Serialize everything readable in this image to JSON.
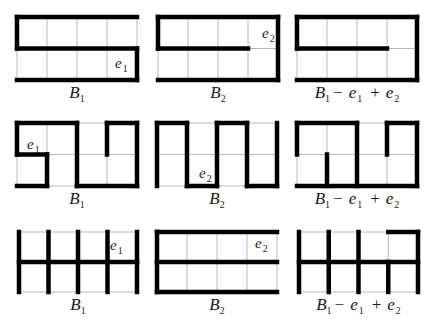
{
  "figure": {
    "grid": {
      "cols": 4,
      "rows": 2
    },
    "rows": [
      {
        "panels": [
          {
            "id": "r1p1",
            "caption": {
              "base": "B",
              "sub": "1"
            },
            "origin": [
              17,
              17
            ],
            "cell": [
              30,
              31.5
            ],
            "edge_label": {
              "text": "e",
              "sub": "1",
              "pos": [
                115,
                68
              ]
            },
            "edges": [
              [
                0,
                0,
                4,
                0
              ],
              [
                0,
                0,
                0,
                1
              ],
              [
                0,
                1,
                4,
                1
              ],
              [
                4,
                1,
                4,
                2
              ],
              [
                0,
                2,
                4,
                2
              ]
            ]
          },
          {
            "id": "r1p2",
            "caption": {
              "base": "B",
              "sub": "2"
            },
            "origin": [
              158,
              17
            ],
            "cell": [
              30,
              31.5
            ],
            "edge_label": {
              "text": "e",
              "sub": "2",
              "pos": [
                262,
                38
              ]
            },
            "edges": [
              [
                0,
                0,
                4,
                0
              ],
              [
                0,
                0,
                0,
                1
              ],
              [
                0,
                1,
                3,
                1
              ],
              [
                4,
                0,
                4,
                2
              ],
              [
                0,
                2,
                4,
                2
              ]
            ]
          },
          {
            "id": "r1p3",
            "caption": {
              "base": "B",
              "sub": "1",
              "minus": "e",
              "minus_sub": "1",
              "plus": "e",
              "plus_sub": "2"
            },
            "origin": [
              297,
              17
            ],
            "cell": [
              30,
              31.5
            ],
            "edges": [
              [
                0,
                0,
                4,
                0
              ],
              [
                0,
                0,
                0,
                1
              ],
              [
                0,
                1,
                3,
                1
              ],
              [
                4,
                0,
                4,
                2
              ],
              [
                0,
                2,
                4,
                2
              ]
            ]
          }
        ]
      },
      {
        "panels": [
          {
            "id": "r2p1",
            "caption": {
              "base": "B",
              "sub": "1"
            },
            "origin": [
              17,
              123
            ],
            "cell": [
              30,
              31.5
            ],
            "edge_label": {
              "text": "e",
              "sub": "1",
              "pos": [
                27,
                149
              ]
            },
            "edges": [
              [
                0,
                0,
                2,
                0
              ],
              [
                0,
                0,
                0,
                1
              ],
              [
                0,
                1,
                1,
                1
              ],
              [
                1,
                1,
                1,
                2
              ],
              [
                0,
                2,
                1,
                2
              ],
              [
                2,
                0,
                2,
                2
              ],
              [
                2,
                2,
                4,
                2
              ],
              [
                4,
                0,
                4,
                2
              ],
              [
                3,
                0,
                4,
                0
              ],
              [
                3,
                0,
                3,
                1
              ]
            ]
          },
          {
            "id": "r2p2",
            "caption": {
              "base": "B",
              "sub": "2"
            },
            "origin": [
              157,
              123
            ],
            "cell": [
              30,
              31.5
            ],
            "edge_label": {
              "text": "e",
              "sub": "2",
              "pos": [
                199,
                178
              ]
            },
            "edges": [
              [
                0,
                0,
                0,
                2
              ],
              [
                0,
                0,
                1,
                0
              ],
              [
                1,
                0,
                1,
                2
              ],
              [
                1,
                2,
                2,
                2
              ],
              [
                2,
                0,
                2,
                2
              ],
              [
                2,
                0,
                3,
                0
              ],
              [
                3,
                0,
                3,
                2
              ],
              [
                3,
                2,
                4,
                2
              ],
              [
                4,
                0,
                4,
                2
              ]
            ]
          },
          {
            "id": "r2p3",
            "caption": {
              "base": "B",
              "sub": "1",
              "minus": "e",
              "minus_sub": "1",
              "plus": "e",
              "plus_sub": "2"
            },
            "origin": [
              297,
              123
            ],
            "cell": [
              30,
              31.5
            ],
            "edges": [
              [
                0,
                0,
                2,
                0
              ],
              [
                0,
                0,
                0,
                1
              ],
              [
                1,
                1,
                1,
                2
              ],
              [
                0,
                2,
                4,
                2
              ],
              [
                2,
                0,
                2,
                2
              ],
              [
                4,
                0,
                4,
                2
              ],
              [
                3,
                0,
                4,
                0
              ],
              [
                3,
                0,
                3,
                1
              ]
            ]
          }
        ]
      },
      {
        "panels": [
          {
            "id": "r3p1",
            "caption": {
              "base": "B",
              "sub": "1"
            },
            "origin": [
              19,
              232
            ],
            "cell": [
              29.5,
              30
            ],
            "edge_label": {
              "text": "e",
              "sub": "1",
              "pos": [
                110,
                250
              ]
            },
            "edges": [
              [
                0,
                0,
                0,
                2
              ],
              [
                1,
                0,
                1,
                2
              ],
              [
                2,
                0,
                2,
                2
              ],
              [
                3,
                0,
                3,
                2
              ],
              [
                4,
                0,
                4,
                2
              ],
              [
                0,
                1,
                4,
                1
              ]
            ]
          },
          {
            "id": "r3p2",
            "caption": {
              "base": "B",
              "sub": "2"
            },
            "origin": [
              157,
              232
            ],
            "cell": [
              30,
              30
            ],
            "edge_label": {
              "text": "e",
              "sub": "2",
              "pos": [
                255,
                248
              ]
            },
            "edges": [
              [
                0,
                0,
                4,
                0
              ],
              [
                0,
                0,
                0,
                2
              ],
              [
                0,
                1,
                4,
                1
              ],
              [
                0,
                2,
                4,
                2
              ]
            ]
          },
          {
            "id": "r3p3",
            "caption": {
              "base": "B",
              "sub": "1",
              "minus": "e",
              "minus_sub": "1",
              "plus": "e",
              "plus_sub": "2"
            },
            "origin": [
              299,
              232
            ],
            "cell": [
              29.75,
              30
            ],
            "edges": [
              [
                0,
                0,
                0,
                2
              ],
              [
                1,
                0,
                1,
                2
              ],
              [
                2,
                0,
                2,
                2
              ],
              [
                3,
                1,
                3,
                2
              ],
              [
                4,
                0,
                4,
                2
              ],
              [
                0,
                1,
                4,
                1
              ],
              [
                3,
                0,
                4,
                0
              ]
            ]
          }
        ]
      }
    ],
    "colors": {
      "grid": "#b8b8b8",
      "edge": "#000000",
      "text": "#1a1a1a",
      "background": "#ffffff"
    }
  }
}
